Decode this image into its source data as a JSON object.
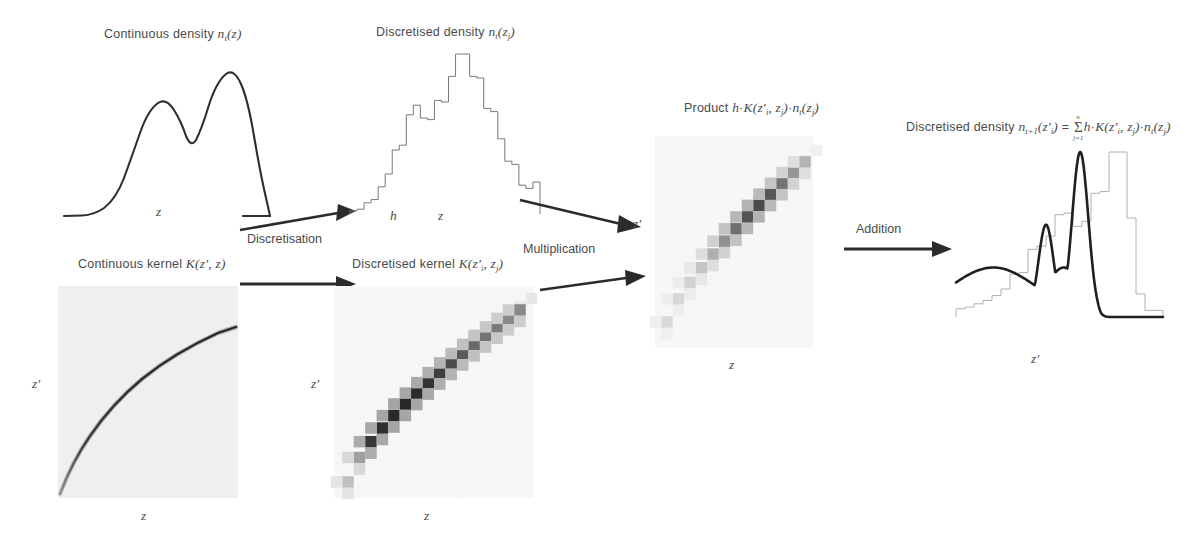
{
  "figure": {
    "type": "diagram",
    "background": "#ffffff",
    "ink": "#3a3a3a"
  },
  "panels": {
    "continuous_density": {
      "caption_prefix": "Continuous density ",
      "caption_symbol": "n",
      "caption_sub": "t",
      "caption_arg": "(z)",
      "xlabel": "z",
      "curve_type": "bimodal continuous density",
      "peaks": [
        {
          "x": 0.36,
          "height": 0.72
        },
        {
          "x": 0.6,
          "height": 1.0
        }
      ],
      "valley": {
        "x": 0.47,
        "height": 0.58
      }
    },
    "discretised_density": {
      "caption_prefix": "Discretised density ",
      "caption_symbol": "n",
      "caption_sub": "t",
      "caption_arg_open": "(z",
      "caption_arg_sub": "j",
      "caption_arg_close": ")",
      "xlabel": "z",
      "binwidth_label": "h",
      "curve_type": "step histogram",
      "bin_values": [
        0.02,
        0.03,
        0.07,
        0.09,
        0.17,
        0.25,
        0.4,
        0.43,
        0.62,
        0.68,
        0.6,
        0.59,
        0.71,
        0.7,
        0.86,
        1.0,
        1.0,
        0.86,
        0.85,
        0.66,
        0.64,
        0.47,
        0.33,
        0.31,
        0.18,
        0.16,
        0.2
      ],
      "n_bins": 27
    },
    "continuous_kernel": {
      "caption_prefix": "Continuous kernel ",
      "caption_symbol": "K",
      "caption_arg": "(z',  z)",
      "xlabel": "z",
      "ylabel": "z'",
      "image_type": "greyscale density map",
      "content": "smooth concave-down ridge from lower-left to upper-right"
    },
    "discretised_kernel": {
      "caption_prefix": "Discretised kernel ",
      "caption_symbol": "K",
      "caption_arg_open": "(z'",
      "caption_arg_sub1": "i",
      "caption_arg_mid": ", z",
      "caption_arg_sub2": "j",
      "caption_arg_close": ")",
      "xlabel": "z",
      "ylabel": "z'",
      "image_type": "greyscale pixelated matrix",
      "content": "staircase of discrete blocks along a concave-down diagonal",
      "n_blocks": 16
    },
    "product": {
      "caption_prefix": "Product ",
      "caption_h": "h",
      "caption_dot1": "·",
      "caption_K": "K",
      "caption_K_open": "(z'",
      "caption_K_sub1": "i",
      "caption_K_mid": ", z",
      "caption_K_sub2": "j",
      "caption_K_close": ")",
      "caption_dot2": "·",
      "caption_n": "n",
      "caption_n_sub": "t",
      "caption_n_open": "(z",
      "caption_n_argsub": "j",
      "caption_n_close": ")",
      "xlabel": "z",
      "ylabel": "z'",
      "image_type": "greyscale pixelated matrix",
      "content": "faded staircase of blocks, weighted by the density",
      "n_blocks": 13
    },
    "result": {
      "caption_prefix": "Discretised density ",
      "caption_n": "n",
      "caption_n_sub": "t+1",
      "caption_n_open": "(z'",
      "caption_n_argsub": "i",
      "caption_n_close": ")",
      "caption_eq": " = ",
      "sum_symbol": "Σ",
      "sum_upper": "n",
      "sum_lower": "j=1",
      "caption_h": "h",
      "caption_dot1": "·",
      "caption_K": "K",
      "caption_K_open": "(z'",
      "caption_K_sub1": "i",
      "caption_K_mid": ", z",
      "caption_K_sub2": "j",
      "caption_K_close": ")",
      "caption_dot2": "·",
      "caption_n2": "n",
      "caption_n2_sub": "t",
      "caption_n2_open": "(z",
      "caption_n2_argsub": "j",
      "caption_n2_close": ")",
      "xlabel": "z'",
      "curve_type": "smooth curve overlaid on step histogram",
      "bin_values": [
        0.05,
        0.06,
        0.08,
        0.1,
        0.13,
        0.17,
        0.26,
        0.27,
        0.41,
        0.43,
        0.49,
        0.62,
        0.63,
        0.55,
        0.58,
        0.75,
        0.76,
        1.0,
        1.0,
        0.6,
        0.14,
        0.04,
        0.04
      ],
      "n_bins": 23,
      "smooth_peaks": [
        {
          "x": 0.45,
          "height": 0.62
        },
        {
          "x": 0.6,
          "height": 1.0
        }
      ]
    }
  },
  "arrows": [
    {
      "id": "discretisation",
      "label": "Discretisation"
    },
    {
      "id": "kernel-discretisation",
      "label": ""
    },
    {
      "id": "multiplication",
      "label": "Multiplication"
    },
    {
      "id": "multiplication-kernel",
      "label": ""
    },
    {
      "id": "addition",
      "label": "Addition"
    }
  ]
}
